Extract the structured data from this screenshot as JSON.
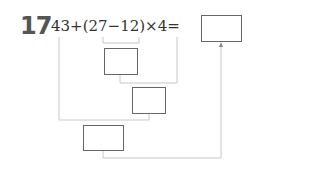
{
  "problem": {
    "number": "17",
    "expression": "43+(27−12)×4=",
    "operands": [
      "43",
      "27",
      "12",
      "4"
    ],
    "answer_box": "",
    "step_boxes": [
      "",
      "",
      ""
    ],
    "line_color": "#c8c8c8",
    "box_border_color": "#666666"
  }
}
